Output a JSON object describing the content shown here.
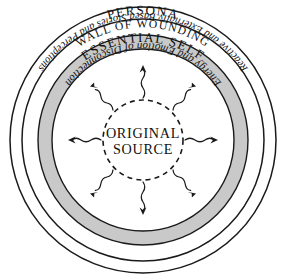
{
  "diagram": {
    "type": "concentric-circles",
    "background_color": "#ffffff",
    "line_color": "#1a1a1a",
    "band_fill_color": "#c9c9c9",
    "center": {
      "x": 143,
      "y": 140
    },
    "labels": {
      "persona": "PERSONA",
      "wall_of_wounding": "WALL OF WOUNDING",
      "essential_self": "ESSENTIAL SELF",
      "energy_emotion": "Energy and Emotion of Disconnection",
      "reactive_stories": "Reactive and Externally Based Stories and Perceptions",
      "original_source_line1": "ORIGINAL",
      "original_source_line2": "SOURCE"
    },
    "rings": [
      {
        "name": "outer-ring",
        "radius": 133,
        "label": "PERSONA",
        "style": "outline"
      },
      {
        "name": "persona-inner-ring",
        "radius": 121,
        "label": "Reactive and Externally Based Stories and Perceptions",
        "style": "outline"
      },
      {
        "name": "wall-of-wounding-band-outer",
        "radius": 105,
        "label": "WALL OF WOUNDING",
        "style": "filled-gray"
      },
      {
        "name": "wall-of-wounding-band-inner",
        "radius": 91,
        "label": "Energy and Emotion of Disconnection",
        "style": "filled-gray"
      },
      {
        "name": "original-source-circle",
        "radius": 40,
        "label": "ORIGINAL SOURCE",
        "style": "dashed"
      }
    ],
    "arrows": {
      "count": 8,
      "style": "wavy-radial-outward",
      "directions": [
        "N",
        "NE",
        "E",
        "SE",
        "S",
        "SW",
        "W",
        "NW"
      ]
    }
  }
}
